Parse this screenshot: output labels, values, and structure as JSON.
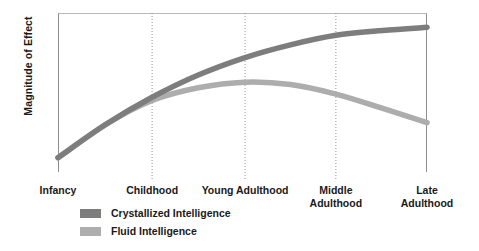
{
  "chart_data": {
    "type": "line",
    "title": "",
    "xlabel": "",
    "ylabel": "Magnitude of Effect",
    "grid": true,
    "legend_position": "bottom-left",
    "categories": [
      "Infancy",
      "Childhood",
      "Young Adulthood",
      "Middle\nAdulthood",
      "Late\nAdulthood"
    ],
    "category_x_fraction": [
      0.0,
      0.255,
      0.507,
      0.753,
      1.0
    ],
    "gridlines_at": [
      "Childhood",
      "Young Adulthood",
      "Middle Adulthood"
    ],
    "xlim": [
      0,
      1
    ],
    "ylim": [
      0,
      1
    ],
    "series": [
      {
        "name": "Crystallized Intelligence",
        "color": "#7d7d7d",
        "x": [
          0.0,
          0.13,
          0.255,
          0.38,
          0.507,
          0.63,
          0.753,
          0.88,
          1.0
        ],
        "values": [
          0.09,
          0.3,
          0.47,
          0.61,
          0.72,
          0.8,
          0.86,
          0.89,
          0.91
        ]
      },
      {
        "name": "Fluid Intelligence",
        "color": "#adadad",
        "x": [
          0.0,
          0.13,
          0.255,
          0.38,
          0.507,
          0.63,
          0.753,
          0.88,
          1.0
        ],
        "values": [
          0.09,
          0.3,
          0.45,
          0.53,
          0.565,
          0.55,
          0.49,
          0.4,
          0.31
        ]
      }
    ]
  },
  "axis": {
    "y_label": "Magnitude of Effect"
  },
  "ticks": [
    {
      "label": "Infancy"
    },
    {
      "label": "Childhood"
    },
    {
      "label": "Young Adulthood"
    },
    {
      "label": "Middle\nAdulthood"
    },
    {
      "label": "Late\nAdulthood"
    }
  ],
  "legend": {
    "items": [
      {
        "label": "Crystallized Intelligence",
        "color": "#7d7d7d"
      },
      {
        "label": "Fluid Intelligence",
        "color": "#adadad"
      }
    ]
  }
}
